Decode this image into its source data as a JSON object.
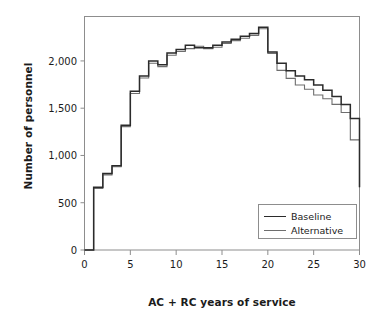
{
  "chart_data": {
    "type": "line",
    "subtype": "step",
    "title": "",
    "xlabel": "AC + RC years of service",
    "ylabel": "Number of personnel",
    "xlim": [
      0,
      30
    ],
    "ylim": [
      0,
      2470
    ],
    "grid": false,
    "legend_position": "lower right",
    "xticks": [
      0,
      5,
      10,
      15,
      20,
      25,
      30
    ],
    "xtick_labels": [
      "0",
      "5",
      "10",
      "15",
      "20",
      "25",
      "30"
    ],
    "yticks": [
      0,
      500,
      1000,
      1500,
      2000
    ],
    "ytick_labels": [
      "0",
      "500",
      "1,000",
      "1,500",
      "2,000"
    ],
    "x": [
      0,
      1,
      2,
      3,
      4,
      5,
      6,
      7,
      8,
      9,
      10,
      11,
      12,
      13,
      14,
      15,
      16,
      17,
      18,
      19,
      20,
      21,
      22,
      23,
      24,
      25,
      26,
      27,
      28,
      29,
      30
    ],
    "series": [
      {
        "name": "Baseline",
        "color": "#2b2b2b",
        "values": [
          0,
          665,
          810,
          890,
          1320,
          1680,
          1840,
          2000,
          1960,
          2085,
          2120,
          2165,
          2140,
          2140,
          2165,
          2200,
          2230,
          2260,
          2290,
          2355,
          2095,
          1975,
          1895,
          1840,
          1800,
          1745,
          1690,
          1625,
          1540,
          1390,
          1195
        ]
      },
      {
        "name": "Alternative",
        "color": "#6e6e6e",
        "values": [
          0,
          650,
          795,
          880,
          1305,
          1655,
          1820,
          1975,
          1940,
          2060,
          2100,
          2130,
          2155,
          2130,
          2145,
          2185,
          2215,
          2240,
          2270,
          2340,
          2080,
          1900,
          1815,
          1745,
          1700,
          1640,
          1600,
          1540,
          1455,
          1165,
          970
        ]
      }
    ],
    "final_drop_value": 665,
    "annotations": []
  },
  "legend": {
    "entries": [
      {
        "label": "Baseline"
      },
      {
        "label": "Alternative"
      }
    ]
  }
}
